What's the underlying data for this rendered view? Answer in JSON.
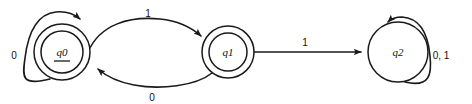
{
  "diagram": {
    "kind": "finite-state-automaton",
    "width": 472,
    "height": 104,
    "background_color": "#ffffff",
    "stroke_color": "#1a1a1a",
    "text_color": "#111111"
  },
  "states": [
    {
      "id": "q0",
      "label": "q0",
      "cx": 62,
      "cy": 52,
      "radius": 28,
      "accepting": true,
      "start": true,
      "underlined": true
    },
    {
      "id": "q1",
      "label": "q1",
      "cx": 228,
      "cy": 52,
      "radius": 26,
      "accepting": true,
      "start": false,
      "underlined": false
    },
    {
      "id": "q2",
      "label": "q2",
      "cx": 398,
      "cy": 52,
      "radius": 30,
      "accepting": false,
      "start": false,
      "underlined": false
    }
  ],
  "transitions": [
    {
      "id": "q0-self",
      "from": "q0",
      "to": "q0",
      "symbols": "0",
      "label": "0",
      "label_x": 14,
      "label_y": 56,
      "shape": "self-loop-left"
    },
    {
      "id": "q0-to-q1",
      "from": "q0",
      "to": "q1",
      "symbols": "1",
      "label": "1",
      "label_x": 148,
      "label_y": 14,
      "shape": "arc-above"
    },
    {
      "id": "q1-to-q0",
      "from": "q1",
      "to": "q0",
      "symbols": "0",
      "label": "0",
      "label_x": 152,
      "label_y": 98,
      "shape": "arc-below"
    },
    {
      "id": "q1-to-q2",
      "from": "q1",
      "to": "q2",
      "symbols": "1",
      "label": "1",
      "label_x": 305,
      "label_y": 43,
      "shape": "straight"
    },
    {
      "id": "q2-self",
      "from": "q2",
      "to": "q2",
      "symbols": "0, 1",
      "label": "0, 1",
      "label_x": 441,
      "label_y": 56,
      "shape": "self-loop-right"
    }
  ]
}
